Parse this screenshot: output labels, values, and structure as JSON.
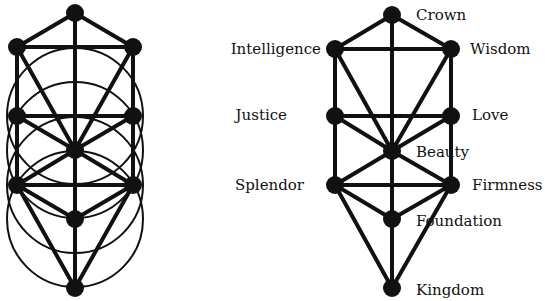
{
  "diagram": {
    "left_figure": {
      "description": "Tree of Life with overlapping circles",
      "nodes": [
        {
          "id": "n1",
          "x": 75,
          "y": 13
        },
        {
          "id": "n2",
          "x": 17,
          "y": 47
        },
        {
          "id": "n3",
          "x": 133,
          "y": 47
        },
        {
          "id": "n4",
          "x": 17,
          "y": 116
        },
        {
          "id": "n5",
          "x": 133,
          "y": 116
        },
        {
          "id": "n6",
          "x": 75,
          "y": 150
        },
        {
          "id": "n7",
          "x": 17,
          "y": 185
        },
        {
          "id": "n8",
          "x": 133,
          "y": 185
        },
        {
          "id": "n9",
          "x": 75,
          "y": 219
        },
        {
          "id": "n10",
          "x": 75,
          "y": 288
        }
      ]
    },
    "right_figure": {
      "nodes": [
        {
          "id": "crown",
          "label": "Crown",
          "x": 392,
          "y": 15
        },
        {
          "id": "intelligence",
          "label": "Intelligence",
          "x": 335,
          "y": 49
        },
        {
          "id": "wisdom",
          "label": "Wisdom",
          "x": 451,
          "y": 49
        },
        {
          "id": "justice",
          "label": "Justice",
          "x": 335,
          "y": 116
        },
        {
          "id": "love",
          "label": "Love",
          "x": 451,
          "y": 116
        },
        {
          "id": "beauty",
          "label": "Beauty",
          "x": 392,
          "y": 151
        },
        {
          "id": "splendor",
          "label": "Splendor",
          "x": 335,
          "y": 185
        },
        {
          "id": "firmness",
          "label": "Firmness",
          "x": 451,
          "y": 185
        },
        {
          "id": "foundation",
          "label": "Foundation",
          "x": 392,
          "y": 219
        },
        {
          "id": "kingdom",
          "label": "Kingdom",
          "x": 392,
          "y": 288
        }
      ]
    },
    "labels": {
      "crown": "Crown",
      "intelligence": "Intelligence",
      "wisdom": "Wisdom",
      "justice": "Justice",
      "love": "Love",
      "beauty": "Beauty",
      "splendor": "Splendor",
      "firmness": "Firmness",
      "foundation": "Foundation",
      "kingdom": "Kingdom"
    },
    "colors": {
      "line": "#111111",
      "node": "#111111",
      "background": "#ffffff"
    }
  }
}
